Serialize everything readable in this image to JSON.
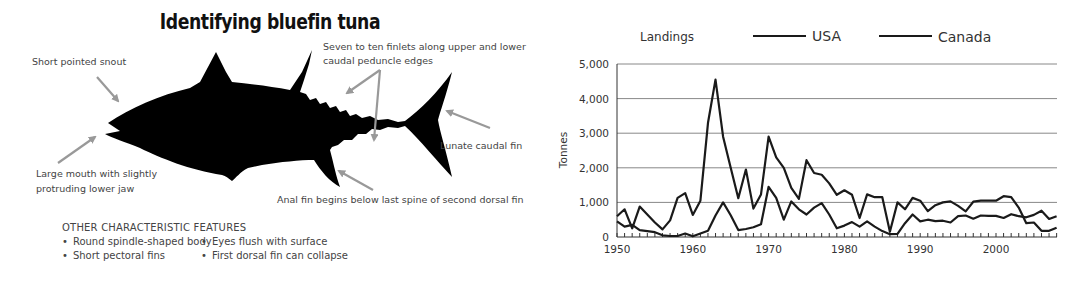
{
  "diagram": {
    "title": "Identifying bluefin tuna",
    "labels": {
      "snout": "Short pointed snout",
      "finlets_line1": "Seven to ten finlets along upper and lower",
      "finlets_line2": "caudal peduncle edges",
      "mouth_line1": "Large mouth with slightly",
      "mouth_line2": "protruding lower jaw",
      "caudal": "Lunate caudal fin",
      "anal": "Anal fin begins below last spine of second dorsal fin"
    },
    "features": {
      "heading": "OTHER CHARACTERISTIC FEATURES",
      "items": [
        "Round spindle-shaped body",
        "Eyes flush with surface",
        "Short pectoral fins",
        "First dorsal fin can collapse"
      ]
    },
    "colors": {
      "fish": "#000000",
      "arrow": "#999999",
      "text": "#444444"
    }
  },
  "chart_data": {
    "type": "line",
    "title": "Landings",
    "xlabel": "",
    "ylabel": "Tonnes",
    "ylim": [
      0,
      5000
    ],
    "xlim": [
      1950,
      2008
    ],
    "yticks": [
      0,
      1000,
      2000,
      3000,
      4000,
      5000
    ],
    "ytick_labels": [
      "0",
      "1,000",
      "2,000",
      "3,000",
      "4,000",
      "5,000"
    ],
    "xticks": [
      1950,
      1960,
      1970,
      1980,
      1990,
      2000
    ],
    "xtick_labels": [
      "1950",
      "1960",
      "1970",
      "1980",
      "1990",
      "2000"
    ],
    "grid": "horizontal",
    "legend_position": "top",
    "x": [
      1950,
      1951,
      1952,
      1953,
      1954,
      1955,
      1956,
      1957,
      1958,
      1959,
      1960,
      1961,
      1962,
      1963,
      1964,
      1965,
      1966,
      1967,
      1968,
      1969,
      1970,
      1971,
      1972,
      1973,
      1974,
      1975,
      1976,
      1977,
      1978,
      1979,
      1980,
      1981,
      1982,
      1983,
      1984,
      1985,
      1986,
      1987,
      1988,
      1989,
      1990,
      1991,
      1992,
      1993,
      1994,
      1995,
      1996,
      1997,
      1998,
      1999,
      2000,
      2001,
      2002,
      2003,
      2004,
      2005,
      2006,
      2007,
      2008
    ],
    "series": [
      {
        "name": "USA",
        "color": "#1a1a1a",
        "values": [
          600,
          800,
          250,
          880,
          650,
          420,
          220,
          480,
          1130,
          1270,
          640,
          1050,
          3300,
          4550,
          2900,
          2000,
          1120,
          1950,
          820,
          1230,
          2900,
          2300,
          2000,
          1420,
          1100,
          2220,
          1850,
          1800,
          1550,
          1220,
          1350,
          1220,
          550,
          1230,
          1150,
          1150,
          150,
          1000,
          800,
          1130,
          1050,
          750,
          920,
          1000,
          1030,
          900,
          740,
          1020,
          1050,
          1050,
          1050,
          1180,
          1150,
          850,
          400,
          420,
          180,
          180,
          270
        ]
      },
      {
        "name": "Canada",
        "color": "#1a1a1a",
        "values": [
          450,
          300,
          350,
          200,
          170,
          140,
          50,
          30,
          30,
          100,
          20,
          100,
          180,
          620,
          1000,
          630,
          200,
          230,
          280,
          370,
          1450,
          1130,
          500,
          1030,
          800,
          650,
          850,
          980,
          650,
          250,
          330,
          430,
          300,
          450,
          300,
          170,
          80,
          90,
          400,
          650,
          450,
          500,
          460,
          470,
          420,
          600,
          620,
          530,
          620,
          610,
          610,
          550,
          660,
          600,
          570,
          640,
          760,
          520,
          600
        ]
      }
    ]
  }
}
